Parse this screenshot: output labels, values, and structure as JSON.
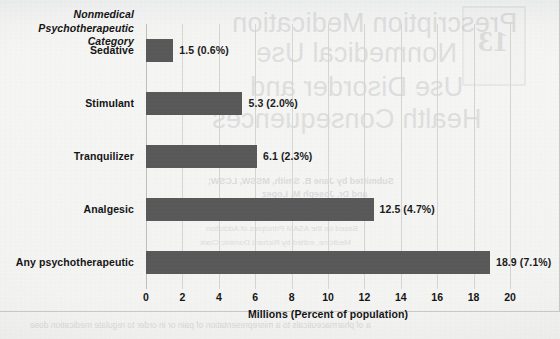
{
  "chart_data": {
    "type": "bar",
    "orientation": "horizontal",
    "title": "",
    "ylabel": "Nonmedical Psychotherapeutic Category",
    "ylabel_lines": [
      "Nonmedical",
      "Psychotherapeutic",
      "Category"
    ],
    "xlabel": "Millions (Percent of population)",
    "categories": [
      "Sedative",
      "Stimulant",
      "Tranquilizer",
      "Analgesic",
      "Any psychotherapeutic"
    ],
    "values": [
      1.5,
      5.3,
      6.1,
      12.5,
      18.9
    ],
    "percents": [
      "0.6%",
      "2.0%",
      "2.3%",
      "4.7%",
      "7.1%"
    ],
    "data_labels": [
      "1.5  (0.6%)",
      "5.3  (2.0%)",
      "6.1  (2.3%)",
      "12.5  (4.7%)",
      "18.9  (7.1%)"
    ],
    "xlim": [
      0,
      20
    ],
    "xticks": [
      0,
      2,
      4,
      6,
      8,
      10,
      12,
      14,
      16,
      18,
      20
    ],
    "xtick_labels": [
      "0",
      "2",
      "4",
      "6",
      "8",
      "10",
      "12",
      "14",
      "16",
      "18",
      "20"
    ],
    "grid": "vertical",
    "legend": "none",
    "bar_color": "#595959",
    "gridline_color": "#d6d6d4",
    "background_color": "#f4f4f3",
    "text_color": "#141414"
  },
  "bleed_through": {
    "title_line1": "Prescription Medication",
    "title_line2": "Nonmedical Use",
    "title_line3": "Use Disorder and",
    "title_line4": "Health Consequences",
    "byline1": "Submitted by Jane B. Smith, MSSW, LCSW;",
    "byline2": "and Dr. Joseph M. Lopez",
    "byline3": "Based on the ASAM Principles of Addiction",
    "byline4": "Medicine, edited by Richard Dominic Clark",
    "footer": "a of pharmaceuticals to a misrepresentation of pain or in order to regulate medication dose",
    "chapter_number": "13"
  }
}
